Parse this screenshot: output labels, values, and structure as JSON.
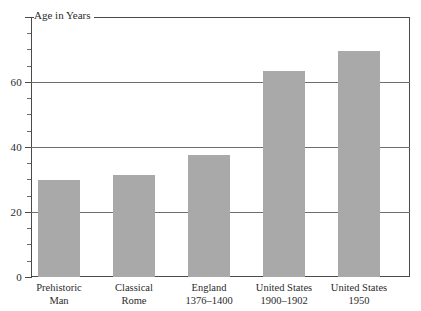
{
  "chart_data": {
    "type": "bar",
    "title": "",
    "subtitle": "",
    "xlabel": "",
    "ylabel": "Age in Years",
    "ylim": [
      0,
      80
    ],
    "grid": true,
    "gridlines_at": [
      20,
      40,
      60
    ],
    "legend": "none",
    "ytick_labels": [
      "0",
      "20",
      "40",
      "60"
    ],
    "ytick_values": [
      0,
      20,
      40,
      60
    ],
    "yminor_step": 5,
    "categories": [
      "Prehistoric Man",
      "Classical Rome",
      "England 1376–1400",
      "United States 1900–1902",
      "United States 1950"
    ],
    "category_lines": [
      [
        "Prehistoric",
        "Man"
      ],
      [
        "Classical",
        "Rome"
      ],
      [
        "England",
        "1376–1400"
      ],
      [
        "United States",
        "1900–1902"
      ],
      [
        "United States",
        "1950"
      ]
    ],
    "values": [
      30,
      31.5,
      37.5,
      63.5,
      69.5
    ],
    "bar_color": "#a9a9a9",
    "axis_color": "#4a4a4a",
    "gridline_color": "#6e6e6e",
    "background_color": "#ffffff"
  }
}
